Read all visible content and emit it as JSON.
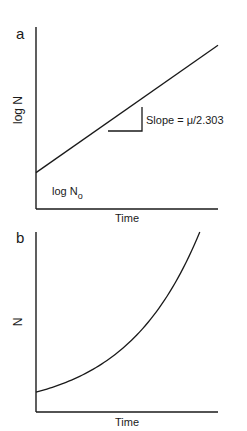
{
  "chart_data": [
    {
      "type": "line",
      "panel_label": "a",
      "xlabel": "Time",
      "ylabel": "log N",
      "annotations": {
        "intercept_label": "log N",
        "intercept_subscript": "o",
        "slope_label": "Slope = μ/2.303"
      },
      "curve": "linear",
      "x": [
        0,
        1
      ],
      "y": [
        0.2,
        0.9
      ],
      "xlim": [
        0,
        1
      ],
      "ylim": [
        0,
        1
      ],
      "grid": false,
      "ticks": false
    },
    {
      "type": "line",
      "panel_label": "b",
      "xlabel": "Time",
      "ylabel": "N",
      "curve": "exponential",
      "x": [
        0,
        0.1,
        0.2,
        0.3,
        0.4,
        0.5,
        0.6,
        0.7,
        0.8,
        0.9
      ],
      "y": [
        0.11,
        0.14,
        0.19,
        0.25,
        0.33,
        0.43,
        0.56,
        0.71,
        0.88,
        1.0
      ],
      "xlim": [
        0,
        1
      ],
      "ylim": [
        0,
        1
      ],
      "grid": false,
      "ticks": false
    }
  ]
}
